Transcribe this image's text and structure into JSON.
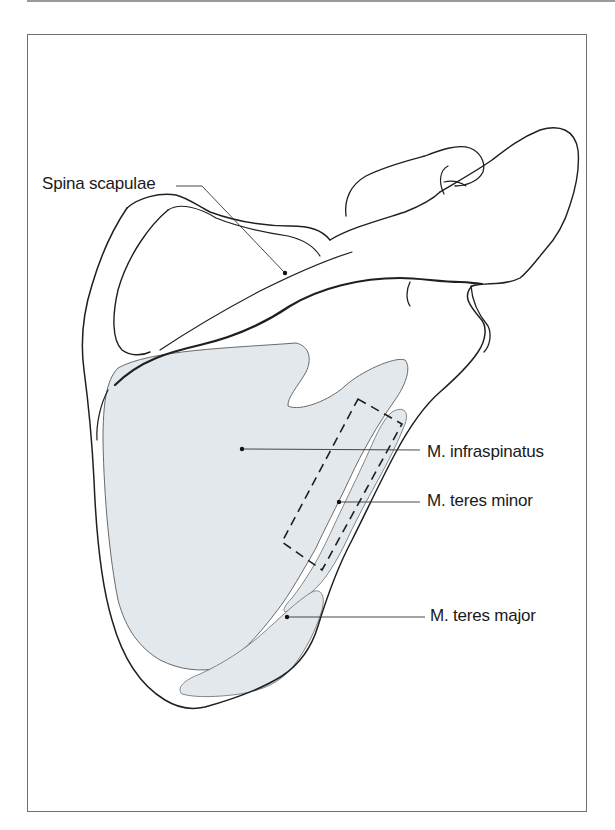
{
  "figure": {
    "type": "anatomical line drawing",
    "colors": {
      "outline": "#1f1f1f",
      "muscle_fill": "#e3e8ec",
      "muscle_edge": "#6a6a6a",
      "frame": "#6f6f6f",
      "label_text": "#1a1a1a"
    }
  },
  "labels": {
    "spina_scapulae": "Spina scapulae",
    "infraspinatus": "M. infraspinatus",
    "teres_minor": "M. teres minor",
    "teres_major": "M. teres major"
  }
}
